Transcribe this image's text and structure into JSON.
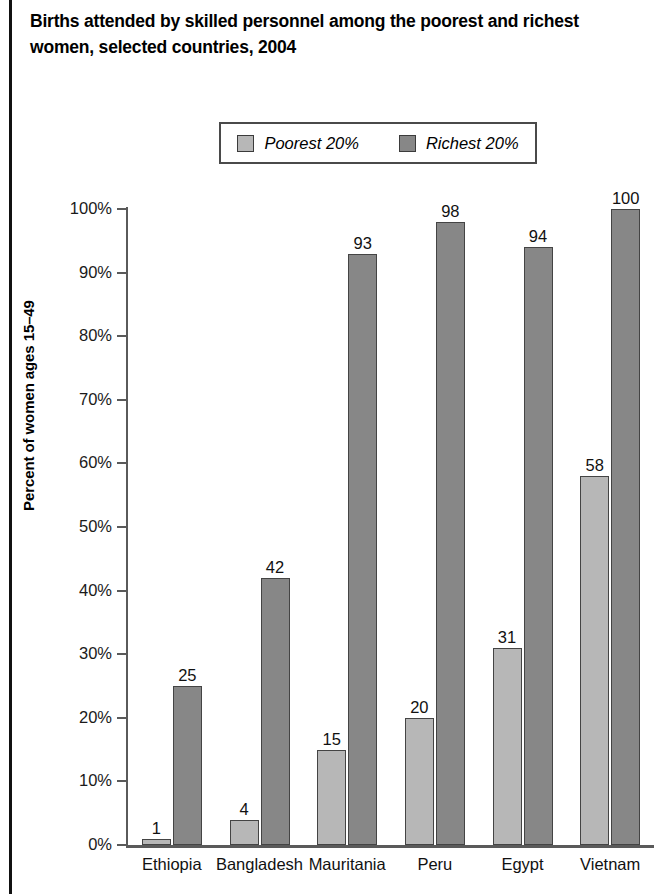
{
  "chart_data": {
    "type": "bar",
    "title": "Births attended by skilled personnel among the poorest and richest women, selected countries, 2004",
    "xlabel": "",
    "ylabel": "Percent of women ages 15–49",
    "ylim": [
      0,
      100
    ],
    "ytick_labels": [
      "100%",
      "90%",
      "80%",
      "70%",
      "60%",
      "50%",
      "40%",
      "30%",
      "20%",
      "10%",
      "0%"
    ],
    "ytick_values": [
      100,
      90,
      80,
      70,
      60,
      50,
      40,
      30,
      20,
      10,
      0
    ],
    "grid": false,
    "legend_position": "top-center",
    "categories": [
      "Ethiopia",
      "Bangladesh",
      "Mauritania",
      "Peru",
      "Egypt",
      "Vietnam"
    ],
    "series": [
      {
        "name": "Poorest 20%",
        "color": "#b7b7b7",
        "values": [
          1,
          4,
          15,
          20,
          31,
          58
        ]
      },
      {
        "name": "Richest 20%",
        "color": "#878787",
        "values": [
          25,
          42,
          93,
          98,
          94,
          100
        ]
      }
    ]
  },
  "legend": {
    "items": [
      {
        "label": "Poorest 20%"
      },
      {
        "label": "Richest 20%"
      }
    ]
  }
}
